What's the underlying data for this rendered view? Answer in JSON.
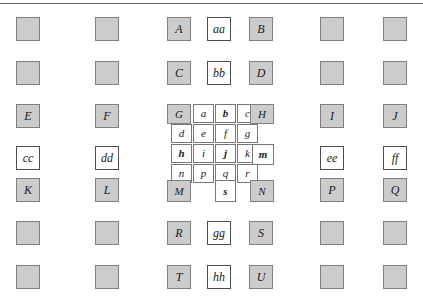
{
  "figure": {
    "title": "",
    "top_rule": true,
    "colors": {
      "shaded_fill": "#cccccc",
      "white_fill": "#ffffff",
      "border": "#808080",
      "text": "#1a1a1a"
    }
  },
  "grid": {
    "columns": 7,
    "rows": 7,
    "macro_cell_px": 24,
    "sub_cell_px": [
      21,
      19
    ]
  },
  "cells": {
    "r1": [
      {
        "id": "r1c1",
        "label": "",
        "style": "shaded"
      },
      {
        "id": "r1c2",
        "label": "",
        "style": "shaded"
      },
      {
        "id": "r1c3",
        "label": "A",
        "style": "shaded"
      },
      {
        "id": "r1c4",
        "label": "aa",
        "style": "white"
      },
      {
        "id": "r1c5",
        "label": "B",
        "style": "shaded"
      },
      {
        "id": "r1c6",
        "label": "",
        "style": "shaded"
      },
      {
        "id": "r1c7",
        "label": "",
        "style": "shaded"
      }
    ],
    "r2": [
      {
        "id": "r2c1",
        "label": "",
        "style": "shaded"
      },
      {
        "id": "r2c2",
        "label": "",
        "style": "shaded"
      },
      {
        "id": "r2c3",
        "label": "C",
        "style": "shaded"
      },
      {
        "id": "r2c4",
        "label": "bb",
        "style": "white"
      },
      {
        "id": "r2c5",
        "label": "D",
        "style": "shaded"
      },
      {
        "id": "r2c6",
        "label": "",
        "style": "shaded"
      },
      {
        "id": "r2c7",
        "label": "",
        "style": "shaded"
      }
    ],
    "r3": [
      {
        "id": "r3c1",
        "label": "E",
        "style": "shaded"
      },
      {
        "id": "r3c2",
        "label": "F",
        "style": "shaded"
      },
      {
        "id": "r3c6",
        "label": "I",
        "style": "shaded"
      },
      {
        "id": "r3c7",
        "label": "J",
        "style": "shaded"
      }
    ],
    "r4": [
      {
        "id": "r4c1",
        "label": "cc",
        "style": "white"
      },
      {
        "id": "r4c2",
        "label": "dd",
        "style": "white"
      },
      {
        "id": "r4c6",
        "label": "ee",
        "style": "white"
      },
      {
        "id": "r4c7",
        "label": "ff",
        "style": "white"
      }
    ],
    "r5": [
      {
        "id": "r5c1",
        "label": "K",
        "style": "shaded"
      },
      {
        "id": "r5c2",
        "label": "L",
        "style": "shaded"
      },
      {
        "id": "r5c6",
        "label": "P",
        "style": "shaded"
      },
      {
        "id": "r5c7",
        "label": "Q",
        "style": "shaded"
      }
    ],
    "r6": [
      {
        "id": "r6c1",
        "label": "",
        "style": "shaded"
      },
      {
        "id": "r6c2",
        "label": "",
        "style": "shaded"
      },
      {
        "id": "r6c3",
        "label": "R",
        "style": "shaded"
      },
      {
        "id": "r6c4",
        "label": "gg",
        "style": "white"
      },
      {
        "id": "r6c5",
        "label": "S",
        "style": "shaded"
      },
      {
        "id": "r6c6",
        "label": "",
        "style": "shaded"
      },
      {
        "id": "r6c7",
        "label": "",
        "style": "shaded"
      }
    ],
    "r7": [
      {
        "id": "r7c1",
        "label": "",
        "style": "shaded"
      },
      {
        "id": "r7c2",
        "label": "",
        "style": "shaded"
      },
      {
        "id": "r7c3",
        "label": "T",
        "style": "shaded"
      },
      {
        "id": "r7c4",
        "label": "hh",
        "style": "white"
      },
      {
        "id": "r7c5",
        "label": "U",
        "style": "shaded"
      },
      {
        "id": "r7c6",
        "label": "",
        "style": "shaded"
      },
      {
        "id": "r7c7",
        "label": "",
        "style": "shaded"
      }
    ]
  },
  "center_block": {
    "rows": [
      {
        "row": 1,
        "cells": [
          {
            "id": "cb-G",
            "label": "G",
            "style": "shaded",
            "weight": "normal"
          },
          {
            "id": "cb-a",
            "label": "a",
            "style": "white",
            "weight": "normal"
          },
          {
            "id": "cb-b",
            "label": "b",
            "style": "white",
            "weight": "bold"
          },
          {
            "id": "cb-c",
            "label": "c",
            "style": "white",
            "weight": "normal"
          },
          {
            "id": "cb-H",
            "label": "H",
            "style": "shaded",
            "weight": "normal"
          }
        ]
      },
      {
        "row": 2,
        "cells": [
          {
            "id": "cb-d",
            "label": "d",
            "style": "white",
            "weight": "normal"
          },
          {
            "id": "cb-e",
            "label": "e",
            "style": "white",
            "weight": "normal"
          },
          {
            "id": "cb-f",
            "label": "f",
            "style": "white",
            "weight": "normal"
          },
          {
            "id": "cb-g",
            "label": "g",
            "style": "white",
            "weight": "normal"
          }
        ]
      },
      {
        "row": 3,
        "cells": [
          {
            "id": "cb-h",
            "label": "h",
            "style": "white",
            "weight": "bold"
          },
          {
            "id": "cb-i",
            "label": "i",
            "style": "white",
            "weight": "normal"
          },
          {
            "id": "cb-j",
            "label": "j",
            "style": "white",
            "weight": "bold"
          },
          {
            "id": "cb-k",
            "label": "k",
            "style": "white",
            "weight": "normal"
          },
          {
            "id": "cb-m",
            "label": "m",
            "style": "white",
            "weight": "bold"
          }
        ]
      },
      {
        "row": 4,
        "cells": [
          {
            "id": "cb-n",
            "label": "n",
            "style": "white",
            "weight": "normal"
          },
          {
            "id": "cb-p",
            "label": "p",
            "style": "white",
            "weight": "normal"
          },
          {
            "id": "cb-q",
            "label": "q",
            "style": "white",
            "weight": "normal"
          },
          {
            "id": "cb-r",
            "label": "r",
            "style": "white",
            "weight": "normal"
          }
        ]
      },
      {
        "row": 5,
        "cells": [
          {
            "id": "cb-M",
            "label": "M",
            "style": "shaded",
            "weight": "normal"
          },
          {
            "id": "cb-s",
            "label": "s",
            "style": "white",
            "weight": "bold"
          },
          {
            "id": "cb-N",
            "label": "N",
            "style": "shaded",
            "weight": "normal"
          }
        ]
      }
    ]
  }
}
